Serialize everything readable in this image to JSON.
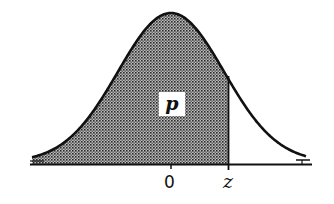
{
  "figure": {
    "type": "normal-distribution-shaded-area",
    "area_label": "p",
    "axis_labels": {
      "center": "0",
      "cutoff": "z"
    },
    "colors": {
      "stroke": "#111111",
      "shade_dot": "#333333",
      "background": "#ffffff"
    }
  }
}
